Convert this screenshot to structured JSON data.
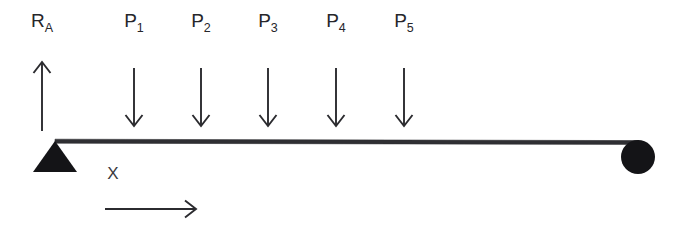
{
  "diagram": {
    "background_color": "#ffffff",
    "stroke_color": "#2b2b2f",
    "support_color": "#141417",
    "label_color": "#26262a",
    "beam": {
      "name": "beam",
      "x_start": 55,
      "x_end": 639,
      "y": 141,
      "thickness": 4
    },
    "supports": [
      {
        "id": "support-pin",
        "type": "pin-triangle",
        "label": "",
        "x": 55,
        "y": 141,
        "half_width": 22,
        "height": 31
      },
      {
        "id": "support-roller",
        "type": "roller-circle",
        "label": "",
        "cx": 638,
        "cy": 157,
        "r": 17
      }
    ],
    "forces": [
      {
        "id": "reaction-ra",
        "label_base": "R",
        "label_sub": "A",
        "direction": "up",
        "x": 42,
        "label_x": 42,
        "label_y": 27,
        "shaft_top": 62,
        "shaft_bottom": 131
      },
      {
        "id": "load-p1",
        "label_base": "P",
        "label_sub": "1",
        "direction": "down",
        "x": 134,
        "label_x": 134,
        "label_y": 27,
        "shaft_top": 68,
        "shaft_bottom": 126
      },
      {
        "id": "load-p2",
        "label_base": "P",
        "label_sub": "2",
        "direction": "down",
        "x": 201,
        "label_x": 201,
        "label_y": 27,
        "shaft_top": 68,
        "shaft_bottom": 126
      },
      {
        "id": "load-p3",
        "label_base": "P",
        "label_sub": "3",
        "direction": "down",
        "x": 268,
        "label_x": 268,
        "label_y": 27,
        "shaft_top": 68,
        "shaft_bottom": 126
      },
      {
        "id": "load-p4",
        "label_base": "P",
        "label_sub": "4",
        "direction": "down",
        "x": 336,
        "label_x": 336,
        "label_y": 27,
        "shaft_top": 68,
        "shaft_bottom": 126
      },
      {
        "id": "load-p5",
        "label_base": "P",
        "label_sub": "5",
        "direction": "down",
        "x": 404,
        "label_x": 404,
        "label_y": 27,
        "shaft_top": 68,
        "shaft_bottom": 126
      }
    ],
    "axis": {
      "id": "x-axis-indicator",
      "label": "X",
      "label_x": 113,
      "label_y": 179,
      "arrow_x_start": 105,
      "arrow_x_end": 196,
      "arrow_y": 209
    }
  },
  "labels": {
    "ra_base": "R",
    "ra_sub": "A",
    "p1_base": "P",
    "p1_sub": "1",
    "p2_base": "P",
    "p2_sub": "2",
    "p3_base": "P",
    "p3_sub": "3",
    "p4_base": "P",
    "p4_sub": "4",
    "p5_base": "P",
    "p5_sub": "5",
    "x_axis": "X"
  }
}
